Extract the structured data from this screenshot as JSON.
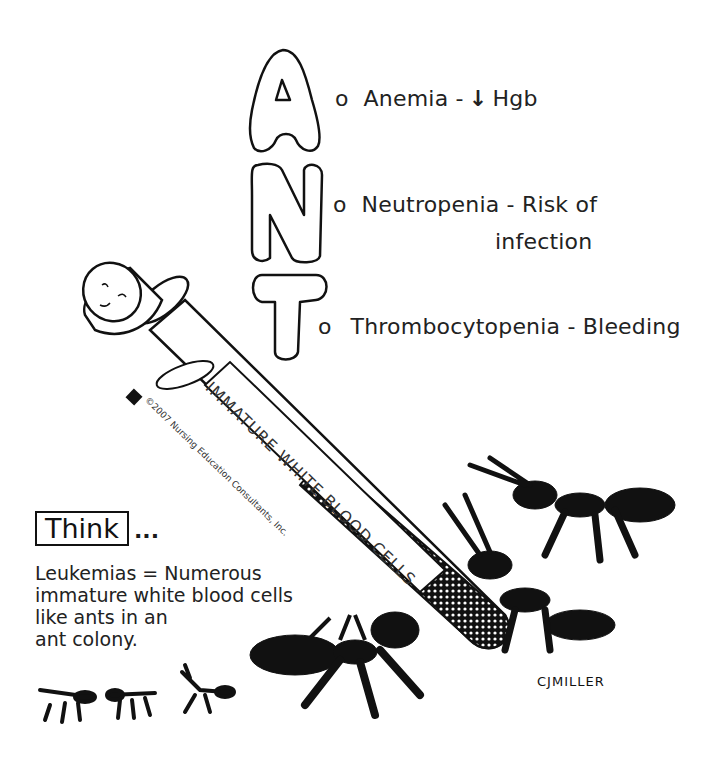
{
  "mnemonic": {
    "letters": [
      "A",
      "N",
      "T"
    ],
    "items": [
      {
        "letter": "A",
        "text": "Anemia -",
        "arrow": "↓",
        "suffix": "Hgb"
      },
      {
        "letter": "N",
        "text": "Neutropenia - Risk of",
        "line2": "infection"
      },
      {
        "letter": "T",
        "text": "Thrombocytopenia - Bleeding"
      }
    ],
    "bullet": "o"
  },
  "tube": {
    "label": "IMMATURE WHITE BLOOD CELLS",
    "copyright": "©2007 Nursing Education Consultants, Inc."
  },
  "think": {
    "box_label": "Think",
    "ellipsis": "...",
    "lines": [
      "Leukemias = Numerous",
      "immature white blood cells",
      "like ants in an",
      "ant colony."
    ]
  },
  "signature": "CJMILLER",
  "colors": {
    "ink": "#111111",
    "background": "#ffffff"
  }
}
